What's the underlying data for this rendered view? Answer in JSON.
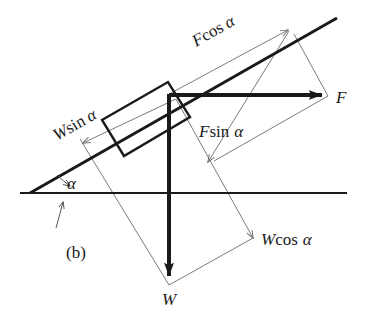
{
  "figure": {
    "panel_label": "(b)",
    "title": "",
    "angle_symbol": "α",
    "colors": {
      "ink": "#1a1a1a",
      "thin_line": "#6b6b6b",
      "background": "#ffffff"
    },
    "labels": {
      "force_F": "F",
      "weight_W": "W",
      "f_cos_alpha_var": "F",
      "f_cos_alpha_fn": "cos",
      "f_cos_alpha_angle": "α",
      "f_sin_alpha_var": "F",
      "f_sin_alpha_fn": "sin",
      "f_sin_alpha_angle": "α",
      "w_sin_alpha_var": "W",
      "w_sin_alpha_fn": "sin",
      "w_sin_alpha_angle": "α",
      "w_cos_alpha_var": "W",
      "w_cos_alpha_fn": "cos",
      "w_cos_alpha_angle": "α"
    },
    "geometry": {
      "incline_angle_deg": 29.7,
      "incline_start": [
        30,
        193
      ],
      "incline_end": [
        337,
        18
      ],
      "horizontal_start": [
        20,
        193
      ],
      "horizontal_end": [
        347,
        193
      ],
      "block_origin": [
        169,
        95
      ],
      "force_F_tip": [
        328,
        96
      ],
      "weight_W_tip": [
        169,
        285
      ],
      "f_cos_tip": [
        288,
        30
      ],
      "f_sin_tip": [
        208,
        162
      ],
      "w_sin_tip": [
        83,
        143
      ],
      "w_cos_tip": [
        253,
        238
      ]
    }
  }
}
